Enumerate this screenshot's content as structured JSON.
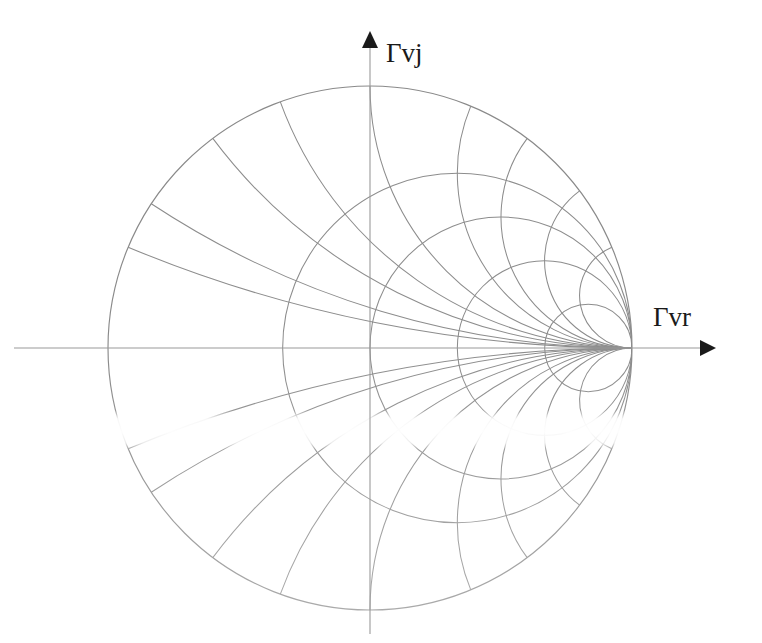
{
  "figure": {
    "kind": "smith-chart",
    "background_color": "#ffffff",
    "line_color": "#8d8d8d",
    "axis_color": "#9a9a9a",
    "label_color": "#1a1a1a",
    "width": 762,
    "height": 643
  },
  "axes": {
    "vertical": {
      "label": "Γvj",
      "label_x": 386,
      "label_y": 60,
      "x": 370,
      "y_top": 32,
      "y_bottom": 634,
      "arrow": "up"
    },
    "horizontal": {
      "label": "Γvr",
      "label_x": 655,
      "label_y": 325,
      "y": 348,
      "x_left": 14,
      "x_right": 714,
      "arrow": "right"
    }
  },
  "chart_data": {
    "type": "line",
    "title": "",
    "subtitle": "",
    "xlabel": "Γvr",
    "ylabel": "Γvj",
    "xlim": [
      -1,
      1
    ],
    "ylim": [
      -1,
      1
    ],
    "grid": true,
    "legend": "none",
    "center": {
      "cx": 370,
      "cy": 348
    },
    "radius": 262,
    "unit_circle": {
      "name": "outer-boundary",
      "r_value": 0,
      "center_uv": [
        0,
        0
      ],
      "radius_uv": 1
    },
    "resistance_circles": {
      "description": "Constant-resistance circles: center (r/(1+r), 0), radius 1/(1+r)",
      "values": [
        0,
        0.5,
        1,
        2,
        5
      ]
    },
    "reactance_arcs": {
      "description": "Constant-reactance arcs: center (1, 1/x), radius |1/x|",
      "values": [
        0.2,
        0.3,
        0.5,
        0.7,
        1,
        1.5,
        2,
        3,
        5,
        -0.2,
        -0.3,
        -0.5,
        -0.7,
        -1,
        -1.5,
        -2,
        -3,
        -5
      ]
    },
    "convergence_point_uv": [
      1,
      0
    ],
    "annotations": [
      {
        "text": "Γvj",
        "position": "top-axis"
      },
      {
        "text": "Γvr",
        "position": "right-axis"
      }
    ]
  },
  "artifacts": {
    "scan_band": {
      "present": true,
      "y_top": 418,
      "y_bottom": 440,
      "note": "horizontal scanner fade band across lower-left of chart"
    },
    "lower_half_fade": true
  }
}
